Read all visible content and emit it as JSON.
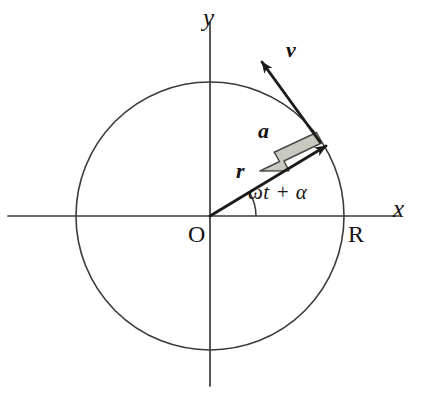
{
  "figure": {
    "background_color": "#ffffff",
    "stroke_color": "#2a2a28",
    "accent_fill": "#c9c9c2"
  },
  "axes": {
    "x_label": "x",
    "y_label": "y",
    "origin_label": "O",
    "x_axis_name": "x-axis",
    "y_axis_name": "y-axis"
  },
  "circle": {
    "radius_label": "R",
    "center_x": 210,
    "center_y": 216,
    "radius": 134
  },
  "vectors": [
    {
      "id": "position",
      "label": "r",
      "description": "position vector from origin to particle",
      "color": "#1b1b19"
    },
    {
      "id": "velocity",
      "label": "v",
      "description": "velocity vector tangent to circle",
      "color": "#1b1b19"
    },
    {
      "id": "acceleration",
      "label": "a",
      "description": "centripetal acceleration vector toward origin",
      "color": "#c9c9c2"
    }
  ],
  "angle": {
    "label": "ωt + α",
    "degrees": 31
  }
}
